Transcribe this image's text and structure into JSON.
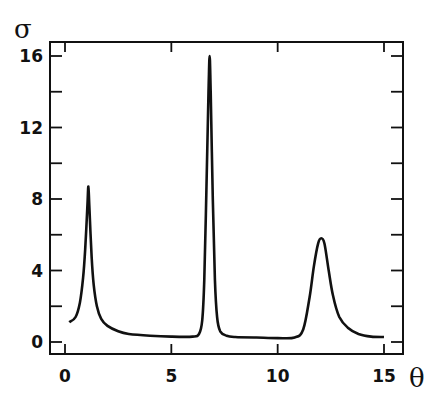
{
  "chart_data": {
    "type": "line",
    "title": "",
    "xlabel": "θ",
    "ylabel": "σ",
    "xlim": [
      -0.7,
      15.9
    ],
    "ylim": [
      -0.7,
      16.8
    ],
    "x_ticks": [
      0,
      5,
      10,
      15
    ],
    "x_tick_labels": [
      "0",
      "5",
      "10",
      "15"
    ],
    "y_ticks": [
      0,
      4,
      8,
      12,
      16
    ],
    "y_tick_labels": [
      "0",
      "4",
      "8",
      "12",
      "16"
    ],
    "grid": false,
    "legend": null,
    "series": [
      {
        "name": "σ(θ)",
        "x": [
          0.2,
          0.5,
          0.7,
          0.85,
          0.95,
          1.05,
          1.1,
          1.15,
          1.25,
          1.35,
          1.5,
          1.7,
          2.0,
          2.5,
          3.0,
          4.0,
          5.0,
          6.0,
          6.3,
          6.45,
          6.55,
          6.65,
          6.75,
          6.8,
          6.85,
          6.95,
          7.05,
          7.15,
          7.3,
          7.6,
          8.0,
          9.0,
          10.0,
          10.8,
          11.2,
          11.5,
          11.7,
          11.9,
          12.05,
          12.2,
          12.4,
          12.6,
          12.9,
          13.3,
          13.8,
          14.4,
          15.0
        ],
        "y": [
          1.1,
          1.4,
          2.2,
          3.6,
          5.2,
          7.5,
          8.7,
          7.4,
          4.8,
          3.2,
          2.0,
          1.3,
          0.9,
          0.6,
          0.45,
          0.35,
          0.3,
          0.3,
          0.45,
          1.2,
          3.5,
          8.5,
          14.0,
          16.0,
          14.0,
          8.0,
          3.5,
          1.4,
          0.6,
          0.35,
          0.28,
          0.25,
          0.22,
          0.25,
          0.7,
          2.5,
          4.2,
          5.5,
          5.8,
          5.5,
          4.0,
          2.6,
          1.4,
          0.8,
          0.45,
          0.3,
          0.28
        ]
      }
    ]
  },
  "axes": {
    "xlabel": "θ",
    "ylabel": "σ",
    "x_tick_labels": [
      "0",
      "5",
      "10",
      "15"
    ],
    "y_tick_labels": [
      "0",
      "4",
      "8",
      "12",
      "16"
    ]
  }
}
